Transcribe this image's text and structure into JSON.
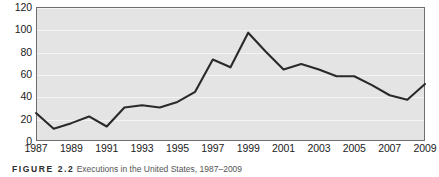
{
  "figure": {
    "caption_label": "FIGURE 2.2",
    "caption_text": "Executions in the United States, 1987–2009"
  },
  "chart_data": {
    "type": "line",
    "title": "",
    "xlabel": "",
    "ylabel": "",
    "x": [
      1987,
      1988,
      1989,
      1990,
      1991,
      1992,
      1993,
      1994,
      1995,
      1996,
      1997,
      1998,
      1999,
      2000,
      2001,
      2002,
      2003,
      2004,
      2005,
      2006,
      2007,
      2008,
      2009
    ],
    "values": [
      25,
      11,
      16,
      22,
      13,
      30,
      32,
      30,
      35,
      44,
      73,
      66,
      97,
      80,
      64,
      69,
      64,
      58,
      58,
      50,
      41,
      37,
      51
    ],
    "series": [
      {
        "name": "Executions",
        "values": [
          25,
          11,
          16,
          22,
          13,
          30,
          32,
          30,
          35,
          44,
          73,
          66,
          97,
          80,
          64,
          69,
          64,
          58,
          58,
          50,
          41,
          37,
          51
        ]
      }
    ],
    "xlim": [
      1987,
      2009
    ],
    "ylim": [
      0,
      120
    ],
    "ytick_labels": [
      "120",
      "100",
      "80",
      "60",
      "40",
      "20",
      "0"
    ],
    "yticks": [
      120,
      100,
      80,
      60,
      40,
      20,
      0
    ],
    "xtick_labels": [
      "1987",
      "1989",
      "1991",
      "1993",
      "1995",
      "1997",
      "1999",
      "2001",
      "2003",
      "2005",
      "2007",
      "2009"
    ],
    "xticks": [
      1987,
      1989,
      1991,
      1993,
      1995,
      1997,
      1999,
      2001,
      2003,
      2005,
      2007,
      2009
    ],
    "grid": true,
    "legend": "none",
    "line_color": "#2a2a2a",
    "plot_bg_color": "#e4e4e4",
    "grid_color": "#f4f4f4",
    "frame_color": "#6e6e6e"
  }
}
